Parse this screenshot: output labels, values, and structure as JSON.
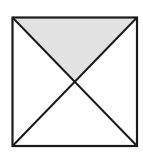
{
  "diagram": {
    "square": {
      "x1": 12.5,
      "y1": 17.5,
      "x2": 137,
      "y2": 146
    },
    "shaded_region": "top-triangle",
    "colors": {
      "stroke": "#1a1a1a",
      "shade": "#e2e2e2",
      "background": "#ffffff"
    }
  }
}
